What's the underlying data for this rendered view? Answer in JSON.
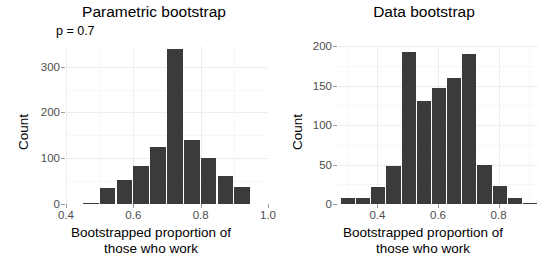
{
  "chart_data": [
    {
      "type": "bar",
      "title": "Parametric bootstrap",
      "subtitle": "p = 0.7",
      "xlabel": "Bootstrapped proportion of those who work",
      "xlabel_line1": "Bootstrapped proportion of",
      "xlabel_line2": "those who work",
      "ylabel": "Count",
      "xlim": [
        0.4,
        1.0
      ],
      "ylim": [
        0,
        345
      ],
      "xticks": [
        0.4,
        0.6,
        0.8,
        1.0
      ],
      "xtick_labels": [
        "0.4",
        "0.6",
        "0.8",
        "1.0"
      ],
      "yticks": [
        0,
        100,
        200,
        300
      ],
      "ytick_labels": [
        "0",
        "100",
        "200",
        "300"
      ],
      "grid": true,
      "bar_color": "#3b3b3b",
      "bin_width": 0.05,
      "bins": [
        {
          "x0": 0.45,
          "x1": 0.5,
          "center": 0.475,
          "count": 3
        },
        {
          "x0": 0.5,
          "x1": 0.55,
          "center": 0.525,
          "count": 36
        },
        {
          "x0": 0.55,
          "x1": 0.6,
          "center": 0.575,
          "count": 53
        },
        {
          "x0": 0.6,
          "x1": 0.65,
          "center": 0.625,
          "count": 83
        },
        {
          "x0": 0.65,
          "x1": 0.7,
          "center": 0.675,
          "count": 125
        },
        {
          "x0": 0.7,
          "x1": 0.75,
          "center": 0.725,
          "count": 338
        },
        {
          "x0": 0.75,
          "x1": 0.8,
          "center": 0.775,
          "count": 140
        },
        {
          "x0": 0.8,
          "x1": 0.85,
          "center": 0.825,
          "count": 100
        },
        {
          "x0": 0.85,
          "x1": 0.9,
          "center": 0.875,
          "count": 62
        },
        {
          "x0": 0.9,
          "x1": 0.95,
          "center": 0.925,
          "count": 38
        }
      ]
    },
    {
      "type": "bar",
      "title": "Data bootstrap",
      "subtitle": "",
      "xlabel": "Bootstrapped proportion of those who work",
      "xlabel_line1": "Bootstrapped proportion of",
      "xlabel_line2": "those who work",
      "ylabel": "Count",
      "xlim": [
        0.27,
        0.93
      ],
      "ylim": [
        0,
        200
      ],
      "xticks": [
        0.4,
        0.6,
        0.8
      ],
      "xtick_labels": [
        "0.4",
        "0.6",
        "0.8"
      ],
      "yticks": [
        0,
        50,
        100,
        150,
        200
      ],
      "ytick_labels": [
        "0",
        "50",
        "100",
        "150",
        "200"
      ],
      "grid": true,
      "bar_color": "#3b3b3b",
      "bin_width": 0.05,
      "bins": [
        {
          "x0": 0.28,
          "x1": 0.33,
          "center": 0.305,
          "count": 7
        },
        {
          "x0": 0.33,
          "x1": 0.38,
          "center": 0.355,
          "count": 8
        },
        {
          "x0": 0.38,
          "x1": 0.43,
          "center": 0.405,
          "count": 22
        },
        {
          "x0": 0.43,
          "x1": 0.48,
          "center": 0.455,
          "count": 48
        },
        {
          "x0": 0.48,
          "x1": 0.53,
          "center": 0.505,
          "count": 192
        },
        {
          "x0": 0.53,
          "x1": 0.58,
          "center": 0.555,
          "count": 130
        },
        {
          "x0": 0.58,
          "x1": 0.63,
          "center": 0.605,
          "count": 147
        },
        {
          "x0": 0.63,
          "x1": 0.68,
          "center": 0.655,
          "count": 160
        },
        {
          "x0": 0.68,
          "x1": 0.73,
          "center": 0.705,
          "count": 190
        },
        {
          "x0": 0.73,
          "x1": 0.78,
          "center": 0.755,
          "count": 49
        },
        {
          "x0": 0.78,
          "x1": 0.83,
          "center": 0.805,
          "count": 23
        },
        {
          "x0": 0.83,
          "x1": 0.88,
          "center": 0.855,
          "count": 8
        },
        {
          "x0": 0.88,
          "x1": 0.93,
          "center": 0.905,
          "count": 1
        }
      ]
    }
  ]
}
